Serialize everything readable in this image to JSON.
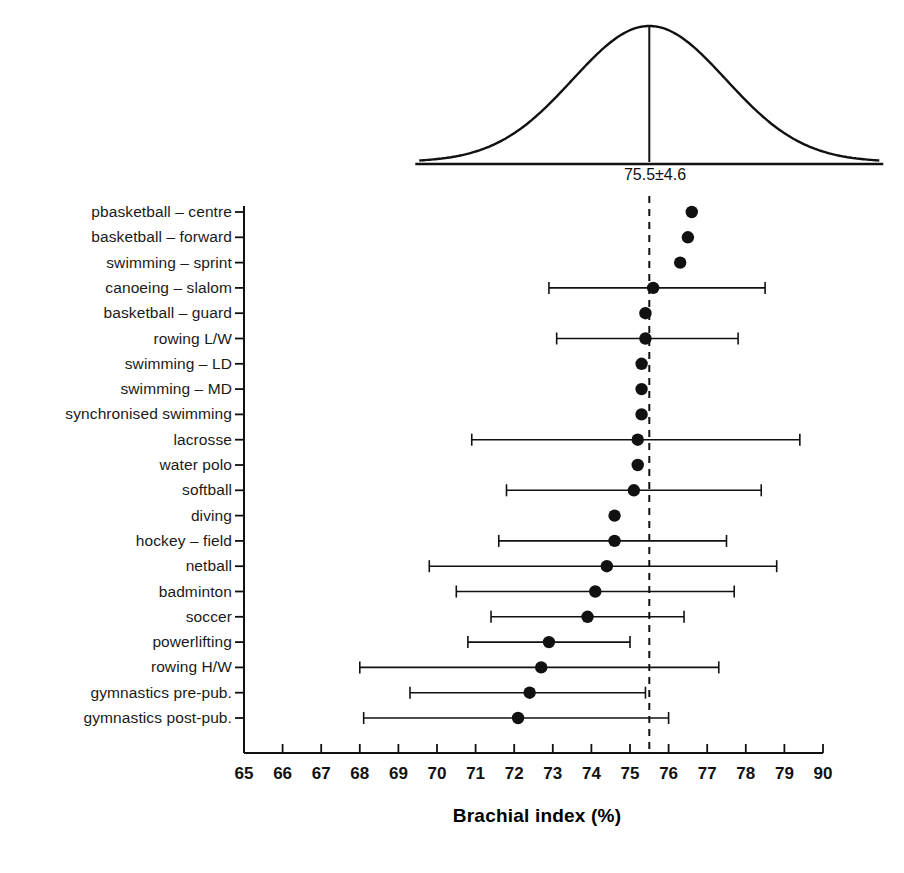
{
  "chart_data": {
    "type": "scatter",
    "title": "",
    "xlabel": "Brachial index (%)",
    "ylabel": "",
    "xlim": [
      65,
      80
    ],
    "xticks": [
      65,
      66,
      67,
      68,
      69,
      70,
      71,
      72,
      73,
      74,
      75,
      76,
      77,
      78,
      79,
      80
    ],
    "xtick_labels": [
      "65",
      "66",
      "67",
      "68",
      "69",
      "70",
      "71",
      "72",
      "73",
      "74",
      "75",
      "76",
      "77",
      "78",
      "79",
      "90"
    ],
    "grid": false,
    "legend": null,
    "reference_line": {
      "value": 75.5,
      "label": "75.5±4.6",
      "style": "dashed"
    },
    "distribution_curve": {
      "mean": 75.5,
      "sd": 4.6,
      "label": "75.5±4.6"
    },
    "categories": [
      "pbasketball – centre",
      "basketball – forward",
      "swimming – sprint",
      "canoeing – slalom",
      "basketball – guard",
      "rowing L/W",
      "swimming – LD",
      "swimming – MD",
      "synchronised swimming",
      "lacrosse",
      "water polo",
      "softball",
      "diving",
      "hockey – field",
      "netball",
      "badminton",
      "soccer",
      "powerlifting",
      "rowing H/W",
      "gymnastics pre-pub.",
      "gymnastics post-pub."
    ],
    "values": [
      76.6,
      76.5,
      76.3,
      75.6,
      75.4,
      75.4,
      75.3,
      75.3,
      75.3,
      75.2,
      75.2,
      75.1,
      74.6,
      74.6,
      74.4,
      74.1,
      73.9,
      72.9,
      72.7,
      72.4,
      72.1
    ],
    "error_low": [
      null,
      null,
      null,
      72.9,
      null,
      73.1,
      null,
      null,
      null,
      70.9,
      null,
      71.8,
      null,
      71.6,
      69.8,
      70.5,
      71.4,
      70.8,
      68.0,
      69.3,
      68.1
    ],
    "error_high": [
      null,
      null,
      null,
      78.5,
      null,
      77.8,
      null,
      null,
      null,
      79.4,
      null,
      78.4,
      null,
      77.5,
      78.8,
      77.7,
      76.4,
      75.0,
      77.3,
      75.4,
      76.0
    ]
  },
  "axis": {
    "x_title": "Brachial index (%)"
  },
  "curve": {
    "caption": "75.5±4.6"
  }
}
